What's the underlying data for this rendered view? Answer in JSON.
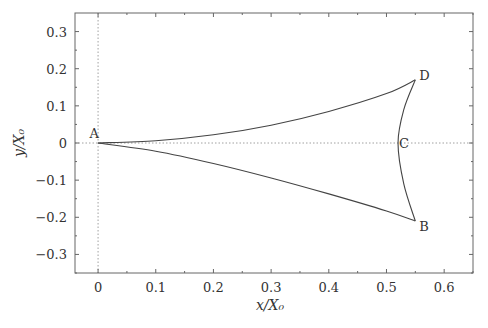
{
  "chart_data": {
    "type": "line",
    "title": "",
    "xlabel": "x/X₀",
    "ylabel": "y/X₀",
    "xlim": [
      -0.04,
      0.65
    ],
    "ylim": [
      -0.35,
      0.35
    ],
    "xticks": [
      0,
      0.1,
      0.2,
      0.3,
      0.4,
      0.5,
      0.6
    ],
    "xtick_labels": [
      "0",
      "0.1",
      "0.2",
      "0.3",
      "0.4",
      "0.5",
      "0.6"
    ],
    "yticks": [
      -0.3,
      -0.2,
      -0.1,
      0,
      0.1,
      0.2,
      0.3
    ],
    "ytick_labels": [
      "−0.3",
      "−0.2",
      "−0.1",
      "0",
      "0.1",
      "0.2",
      "0.3"
    ],
    "grid": false,
    "legend": null,
    "reference_lines": [
      {
        "orientation": "vertical",
        "x": 0,
        "style": "dotted"
      },
      {
        "orientation": "horizontal",
        "y": 0,
        "style": "dotted"
      }
    ],
    "points": [
      {
        "label": "A",
        "x": 0.0,
        "y": 0.0
      },
      {
        "label": "B",
        "x": 0.55,
        "y": -0.21
      },
      {
        "label": "C",
        "x": 0.52,
        "y": 0.0
      },
      {
        "label": "D",
        "x": 0.55,
        "y": 0.17
      }
    ],
    "series": [
      {
        "name": "A-D",
        "x": [
          0,
          0.1,
          0.2,
          0.3,
          0.4,
          0.5,
          0.55
        ],
        "y": [
          0,
          0.006,
          0.022,
          0.048,
          0.085,
          0.133,
          0.17
        ]
      },
      {
        "name": "A-B",
        "x": [
          0,
          0.1,
          0.2,
          0.3,
          0.4,
          0.5,
          0.55
        ],
        "y": [
          0,
          -0.022,
          -0.055,
          -0.094,
          -0.137,
          -0.183,
          -0.21
        ]
      },
      {
        "name": "D-C-B",
        "x": [
          0.55,
          0.53,
          0.52,
          0.53,
          0.55
        ],
        "y": [
          0.17,
          0.09,
          0.0,
          -0.11,
          -0.21
        ]
      }
    ]
  }
}
